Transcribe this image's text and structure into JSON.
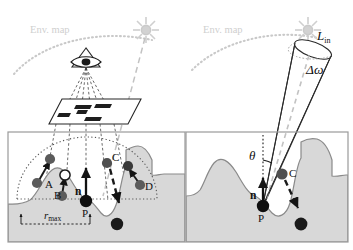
{
  "figure": {
    "type": "diagram",
    "panel_count": 2,
    "background_color": "#ffffff",
    "terrain_fill": "#d8d8d8",
    "terrain_stroke": "#8a8a8a",
    "envmap_color": "#c9c9c9",
    "sun_color": "#cfcfcf",
    "ink_color": "#111111"
  },
  "panels": [
    {
      "id": "left-panel",
      "name": "camera-and-samples-panel",
      "labels": {
        "env_map": "Env. map",
        "normal": "n",
        "point": "P",
        "sample_a": "A",
        "sample_b": "B",
        "sample_c": "C",
        "sample_d": "D",
        "radius": "r",
        "radius_sub": "max"
      },
      "icons": {
        "sun": "sun-icon",
        "camera": "camera-eye-icon",
        "image_plane": "image-plane-icon"
      },
      "samples": [
        {
          "label": "A",
          "head": "filled",
          "tail": "filled",
          "direction": "up-right"
        },
        {
          "label": "B",
          "head": "hollow",
          "tail": "filled",
          "direction": "up"
        },
        {
          "label": "C",
          "head": "filled",
          "tail": "filled",
          "direction": "down",
          "style": "dashed"
        },
        {
          "label": "D",
          "head": "filled",
          "tail": "filled",
          "direction": "up-right"
        }
      ]
    },
    {
      "id": "right-panel",
      "name": "solid-angle-panel",
      "labels": {
        "env_map": "Env. map",
        "radiance": "L",
        "radiance_sub": "in",
        "solid_angle": "Δω",
        "theta": "θ",
        "normal": "n",
        "point": "P",
        "sample_c": "C"
      },
      "icons": {
        "sun": "sun-icon",
        "cone": "solid-angle-cone-icon"
      }
    }
  ]
}
